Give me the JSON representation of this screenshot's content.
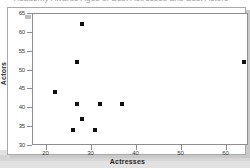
{
  "figure": {
    "title_fragment": "Academy Awards Ages of Best Actresses and Best Actors",
    "background_color": "#ffffff",
    "frame_color": "#8e8e8e",
    "marker_color": "#111111"
  },
  "axes": {
    "x_title": "Actresses",
    "y_title": "Actors",
    "x_ticks": [
      "20",
      "30",
      "40",
      "50",
      "60"
    ],
    "y_ticks": [
      "30",
      "35",
      "40",
      "45",
      "50",
      "55",
      "60",
      "65"
    ]
  },
  "chart_data": {
    "type": "scatter",
    "title": "",
    "xlabel": "Actresses",
    "ylabel": "Actors",
    "xlim": [
      17,
      65
    ],
    "ylim": [
      30,
      65
    ],
    "xticks": [
      20,
      30,
      40,
      50,
      60
    ],
    "yticks": [
      30,
      35,
      40,
      45,
      50,
      55,
      60,
      65
    ],
    "grid": false,
    "legend": false,
    "series": [
      {
        "name": "Best Actress vs Best Actor ages",
        "points": [
          {
            "x": 22,
            "y": 44
          },
          {
            "x": 27,
            "y": 52
          },
          {
            "x": 28,
            "y": 62
          },
          {
            "x": 26,
            "y": 34
          },
          {
            "x": 27,
            "y": 41
          },
          {
            "x": 28,
            "y": 37
          },
          {
            "x": 31,
            "y": 34
          },
          {
            "x": 32,
            "y": 41
          },
          {
            "x": 37,
            "y": 41
          },
          {
            "x": 64,
            "y": 52
          }
        ]
      }
    ]
  }
}
